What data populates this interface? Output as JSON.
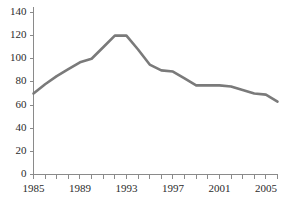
{
  "chart_data": {
    "type": "line",
    "title": "",
    "subtitle": "",
    "xlabel": "",
    "ylabel": "",
    "xlim": [
      1985,
      2006
    ],
    "ylim": [
      0,
      140
    ],
    "grid": false,
    "legend": false,
    "legend_position": "none",
    "series_color": "#7a7a7a",
    "axis_color": "#8a8a8a",
    "text_color": "#2b2b2b",
    "y_ticks": [
      0,
      20,
      40,
      60,
      80,
      100,
      120,
      140
    ],
    "y_tick_labels": [
      "0",
      "20",
      "40",
      "60",
      "80",
      "100",
      "120",
      "140"
    ],
    "x_ticks": [
      1985,
      1986,
      1987,
      1988,
      1989,
      1990,
      1991,
      1992,
      1993,
      1994,
      1995,
      1996,
      1997,
      1998,
      1999,
      2000,
      2001,
      2002,
      2003,
      2004,
      2005,
      2006
    ],
    "x_tick_labels_shown": [
      "1985",
      "1989",
      "1993",
      "1997",
      "2001",
      "2005"
    ],
    "x_labeled_ticks": [
      1985,
      1989,
      1993,
      1997,
      2001,
      2005
    ],
    "x": [
      1985,
      1986,
      1987,
      1988,
      1989,
      1990,
      1991,
      1992,
      1993,
      1994,
      1995,
      1996,
      1997,
      1998,
      1999,
      2000,
      2001,
      2002,
      2003,
      2004,
      2005,
      2006
    ],
    "values": [
      70,
      78,
      85,
      91,
      97,
      100,
      110,
      120,
      120,
      108,
      95,
      90,
      89,
      83,
      77,
      77,
      77,
      76,
      73,
      70,
      69,
      63
    ],
    "series": [
      {
        "name": "series-1",
        "color": "#7a7a7a",
        "values": [
          70,
          78,
          85,
          91,
          97,
          100,
          110,
          120,
          120,
          108,
          95,
          90,
          89,
          83,
          77,
          77,
          77,
          76,
          73,
          70,
          69,
          63
        ]
      }
    ]
  }
}
